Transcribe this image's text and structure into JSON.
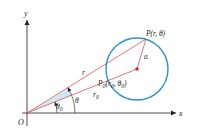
{
  "diagram": {
    "colors": {
      "axes": "#231f20",
      "rays": "#d9534f",
      "circle": "#2e8fd0",
      "center_point": "#d9232e",
      "wedge": "#cfe6f3",
      "label": "#231f20"
    },
    "axes": {
      "x_label": "x",
      "y_label": "y",
      "origin_label": "O"
    },
    "points": {
      "P": {
        "label": "P(r, θ)",
        "x": 146,
        "y": 39
      },
      "P0": {
        "label_main": "P",
        "label_sub": "0",
        "label_rest": "(r",
        "label_sub2": "0",
        "label_mid": ", θ",
        "label_sub3": "0",
        "label_end": ")",
        "x": 137,
        "y": 69
      }
    },
    "segments": {
      "r_label": "r",
      "r0_label": "r",
      "r0_sub": "0",
      "a_label": "a"
    },
    "angles": {
      "theta_label": "θ",
      "theta0_label": "θ",
      "theta0_sub": "0"
    },
    "circle": {
      "cx": 137,
      "cy": 69,
      "radius": 31
    }
  }
}
